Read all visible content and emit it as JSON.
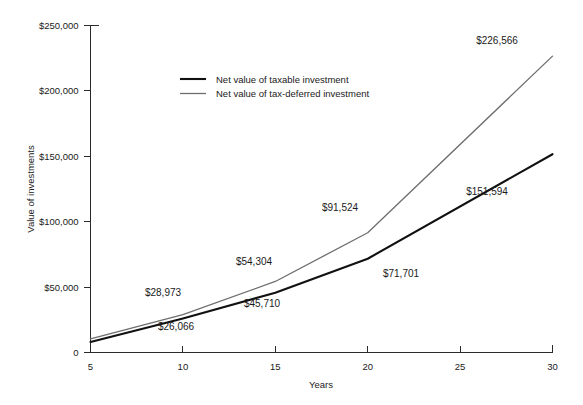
{
  "chart_data": {
    "type": "line",
    "title": "",
    "subtitle": "",
    "xlabel": "Years",
    "ylabel": "Value of investments",
    "x": [
      5,
      10,
      15,
      20,
      30
    ],
    "xlim": [
      5,
      30
    ],
    "ylim": [
      0,
      250000
    ],
    "xticks": [
      5,
      10,
      15,
      20,
      25,
      30
    ],
    "xtick_labels": [
      "5",
      "10",
      "15",
      "20",
      "25",
      "30"
    ],
    "yticks": [
      0,
      50000,
      100000,
      150000,
      200000,
      250000
    ],
    "ytick_labels": [
      "0",
      "$50,000",
      "$100,000",
      "$150,000",
      "$200,000",
      "$250,000"
    ],
    "grid": false,
    "legend_position": "upper-left-inside",
    "series": [
      {
        "name": "Net value of taxable investment",
        "color": "#111111",
        "width": 2.1,
        "values": [
          8000,
          26066,
          45710,
          71701,
          151594
        ],
        "point_labels": [
          "",
          "$26,066",
          "$45,710",
          "$71,701",
          "$151,594"
        ]
      },
      {
        "name": "Net value of tax-deferred investment",
        "color": "#6e6e6e",
        "width": 1.3,
        "values": [
          10500,
          28973,
          54304,
          91524,
          226566
        ],
        "point_labels": [
          "",
          "$28,973",
          "$54,304",
          "$91,524",
          "$226,566"
        ]
      }
    ],
    "annotations": [
      {
        "text": "$28,973",
        "x": 163,
        "y": 296,
        "series": "Net value of tax-deferred investment"
      },
      {
        "text": "$26,066",
        "x": 176,
        "y": 330,
        "series": "Net value of taxable investment"
      },
      {
        "text": "$54,304",
        "x": 254,
        "y": 265,
        "series": "Net value of tax-deferred investment"
      },
      {
        "text": "$45,710",
        "x": 262,
        "y": 307,
        "series": "Net value of taxable investment"
      },
      {
        "text": "$91,524",
        "x": 340,
        "y": 211,
        "series": "Net value of tax-deferred investment"
      },
      {
        "text": "$71,701",
        "x": 401,
        "y": 277,
        "series": "Net value of taxable investment"
      },
      {
        "text": "$226,566",
        "x": 497,
        "y": 44,
        "series": "Net value of tax-deferred investment"
      },
      {
        "text": "$151,594",
        "x": 487,
        "y": 195,
        "series": "Net value of taxable investment"
      }
    ]
  },
  "legend": {
    "entries": [
      {
        "label": "Net value of taxable investment"
      },
      {
        "label": "Net value of tax-deferred investment"
      }
    ]
  }
}
